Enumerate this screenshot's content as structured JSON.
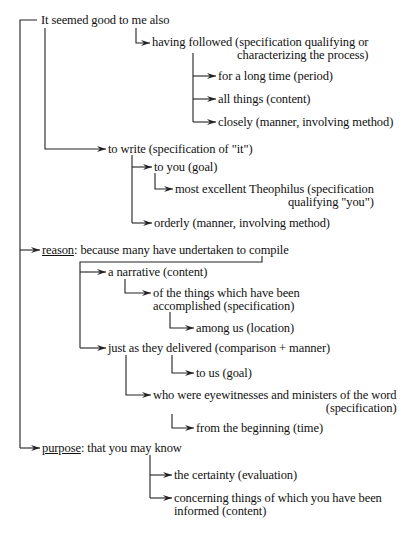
{
  "diagram": {
    "type": "hierarchical clause analysis",
    "nodes": [
      {
        "id": "n1",
        "text": "It seemed good to me also",
        "x": 41,
        "y": 14
      },
      {
        "id": "n2",
        "line1": "having followed (specification qualifying or",
        "line2": "characterizing the process)",
        "x": 152,
        "y": 36,
        "align2": "right"
      },
      {
        "id": "n3",
        "text": "for a long time (period)",
        "x": 218,
        "y": 70
      },
      {
        "id": "n4",
        "text": "all things (content)",
        "x": 218,
        "y": 93
      },
      {
        "id": "n5",
        "text": "closely (manner, involving method)",
        "x": 218,
        "y": 116
      },
      {
        "id": "n6",
        "text": "to write (specification of \"it\")",
        "x": 108,
        "y": 141
      },
      {
        "id": "n7",
        "text": "to you (goal)",
        "x": 154,
        "y": 161
      },
      {
        "id": "n8",
        "line1": "most excellent Theophilus (specification",
        "line2": "qualifying \"you\")",
        "x": 175,
        "y": 183,
        "align2": "right"
      },
      {
        "id": "n9",
        "text": "orderly (manner, involving method)",
        "x": 154,
        "y": 217
      },
      {
        "id": "n10",
        "label": "reason",
        "rest": ": because many have undertaken to compile",
        "x": 42,
        "y": 243
      },
      {
        "id": "n11",
        "text": "a narrative (content)",
        "x": 108,
        "y": 266
      },
      {
        "id": "n12",
        "line1": "of the things which have been",
        "line2": "accomplished (specification)",
        "x": 153,
        "y": 287,
        "align2": "left"
      },
      {
        "id": "n13",
        "text": "among us (location)",
        "x": 196,
        "y": 322
      },
      {
        "id": "n14",
        "text": "just as they delivered (comparison + manner)",
        "x": 108,
        "y": 342
      },
      {
        "id": "n15",
        "text": "to us (goal)",
        "x": 196,
        "y": 367
      },
      {
        "id": "n16",
        "line1": "who were eyewitnesses and ministers of the word",
        "line2": "(specification)",
        "x": 153,
        "y": 389,
        "align2": "right"
      },
      {
        "id": "n17",
        "text": "from the beginning (time)",
        "x": 196,
        "y": 422
      },
      {
        "id": "n18",
        "label": "purpose",
        "rest": ": that you may know",
        "x": 42,
        "y": 442
      },
      {
        "id": "n19",
        "text": "the certainty (evaluation)",
        "x": 174,
        "y": 469
      },
      {
        "id": "n20",
        "line1": "concerning things of which you have been",
        "line2": "informed (content)",
        "x": 174,
        "y": 492,
        "align2": "left"
      }
    ],
    "line_color": "#222222",
    "text_color": "#111111",
    "background": "#ffffff"
  }
}
